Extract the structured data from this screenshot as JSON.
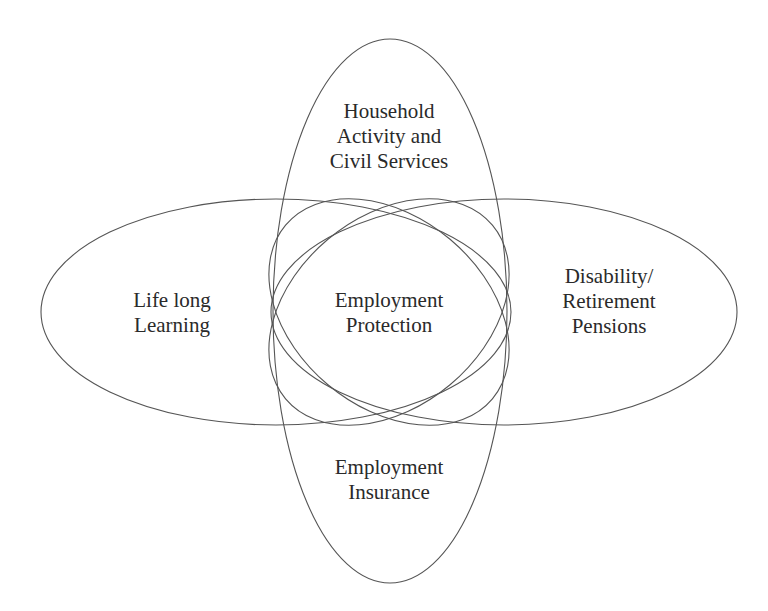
{
  "diagram": {
    "type": "overlapping-ellipses",
    "stroke_color": "#555555",
    "background": "#ffffff",
    "regions": {
      "top": {
        "lines": [
          "Household",
          "Activity and",
          "Civil Services"
        ]
      },
      "left": {
        "lines": [
          "Life long",
          "Learning"
        ]
      },
      "center": {
        "lines": [
          "Employment",
          "Protection"
        ]
      },
      "right": {
        "lines": [
          "Disability/",
          "Retirement",
          "Pensions"
        ]
      },
      "bottom": {
        "lines": [
          "Employment",
          "Insurance"
        ]
      }
    }
  }
}
